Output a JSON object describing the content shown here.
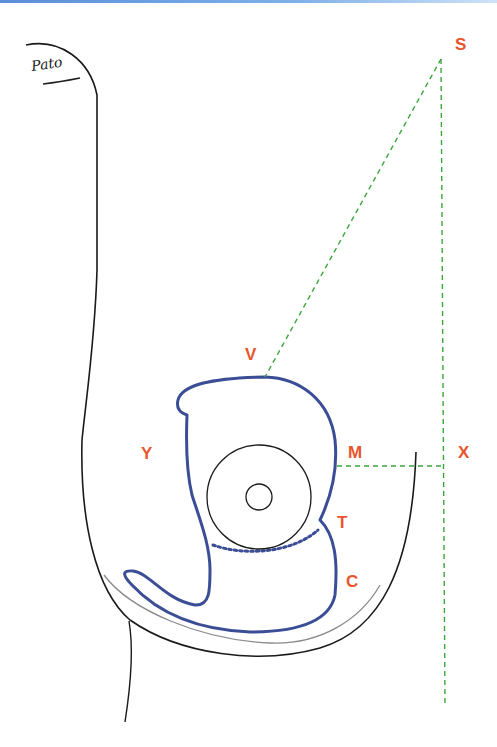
{
  "figure": {
    "signature": "Pato",
    "colors": {
      "outline_black": "#1a1a1a",
      "outline_grey": "#8a8a8a",
      "incision_blue": "#3a4d95",
      "guide_green": "#3aa63a",
      "label_orange": "#e8552c",
      "top_rule_blue": "#5a8fd8"
    },
    "labels": {
      "S": "S",
      "V": "V",
      "Y": "Y",
      "M": "M",
      "X": "X",
      "T": "T",
      "C": "C"
    },
    "elements": [
      {
        "name": "breast-contour",
        "style": "solid black"
      },
      {
        "name": "inframammary-inner-contour",
        "style": "solid grey"
      },
      {
        "name": "incision-outline",
        "style": "solid blue"
      },
      {
        "name": "areola-lower-border",
        "style": "dotted blue"
      },
      {
        "name": "areola",
        "style": "black circle"
      },
      {
        "name": "nipple",
        "style": "black circle"
      },
      {
        "name": "guide-line-SV",
        "style": "dashed green"
      },
      {
        "name": "guide-line-SX",
        "style": "dashed green"
      },
      {
        "name": "guide-line-MX",
        "style": "dashed green"
      }
    ]
  }
}
